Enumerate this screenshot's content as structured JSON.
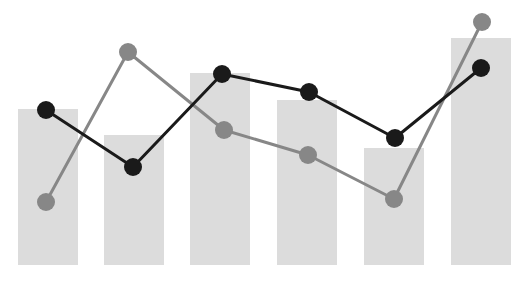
{
  "chart_data": {
    "type": "bar",
    "title": "",
    "subtitle": "",
    "xlabel": "",
    "ylabel": "",
    "grid": false,
    "legend": false,
    "legend_position": "none",
    "axis_visible": false,
    "tick_labels_visible": false,
    "categories": [
      "1",
      "2",
      "3",
      "4",
      "5",
      "6"
    ],
    "xlim": [
      0,
      6
    ],
    "ylim": [
      0,
      100
    ],
    "bar_series": {
      "name": "Bars",
      "color": "#dcdcdc",
      "values": [
        61,
        51,
        75,
        65,
        46,
        88
      ]
    },
    "series": [
      {
        "name": "Dark line",
        "type": "line",
        "color": "#1a1a1a",
        "marker": "circle",
        "values": [
          60,
          37,
          72,
          65,
          48,
          75
        ]
      },
      {
        "name": "Grey line",
        "type": "line",
        "color": "#878787",
        "marker": "circle",
        "values": [
          24,
          81,
          51,
          41,
          25,
          92
        ]
      }
    ],
    "geometry": {
      "plot_width": 532,
      "plot_height": 282,
      "baseline_y": 265,
      "bar_width": 60,
      "bar_centers_x": [
        48,
        134,
        220,
        307,
        394,
        481
      ],
      "bar_tops_y": [
        109,
        135,
        73,
        100,
        148,
        38
      ],
      "dark_points_xy": [
        [
          46,
          110
        ],
        [
          133,
          167
        ],
        [
          222,
          74
        ],
        [
          309,
          92
        ],
        [
          395,
          138
        ],
        [
          481,
          68
        ]
      ],
      "grey_points_xy": [
        [
          46,
          202
        ],
        [
          128,
          52
        ],
        [
          224,
          130
        ],
        [
          308,
          155
        ],
        [
          394,
          199
        ],
        [
          482,
          22
        ]
      ],
      "marker_radius_dark": 9,
      "marker_radius_grey": 9,
      "line_width_dark": 3,
      "line_width_grey": 3
    },
    "colors": {
      "background": "#ffffff",
      "bar": "#dcdcdc",
      "dark_series": "#1a1a1a",
      "grey_series": "#878787"
    },
    "annotations": []
  }
}
